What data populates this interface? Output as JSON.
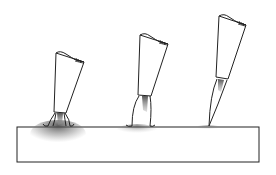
{
  "figure": {
    "colors": {
      "background": "#ffffff",
      "line": "#222222",
      "ink": "#555555",
      "stipple": "#444444"
    },
    "surface": {
      "x": 17,
      "y": 127,
      "width": 242,
      "height": 35
    },
    "brushes": [
      {
        "id": "heavy-pressure",
        "pressure": "heavy",
        "tip_x": 60,
        "tip_y": 127
      },
      {
        "id": "medium-pressure",
        "pressure": "medium",
        "tip_x": 145,
        "tip_y": 127
      },
      {
        "id": "light-pressure",
        "pressure": "light",
        "tip_x": 209,
        "tip_y": 126
      }
    ]
  }
}
